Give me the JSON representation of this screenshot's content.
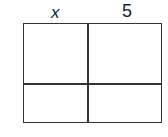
{
  "diagram": {
    "type": "area-model-grid",
    "column_labels": [
      "x",
      "5"
    ],
    "rows": 2,
    "columns": 2,
    "cells": [
      [
        "",
        ""
      ],
      [
        "",
        ""
      ]
    ],
    "line_color": "#333333"
  }
}
